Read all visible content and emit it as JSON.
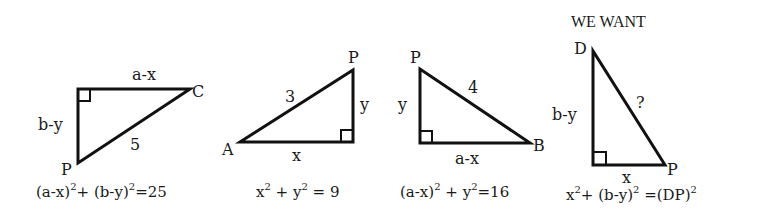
{
  "colors": {
    "ink": "#111111",
    "background": "#ffffff"
  },
  "triangles": [
    {
      "id": "triangle-1",
      "vertices": [
        "C",
        "P"
      ],
      "labels": {
        "top_side": "a-x",
        "left_side": "b-y",
        "hypotenuse": "5",
        "vertex_c": "C",
        "vertex_p": "P"
      },
      "equation": {
        "t1": "(a-x)",
        "s1": "2",
        "t2": "+ (b-y)",
        "s2": "2",
        "t3": "=25"
      }
    },
    {
      "id": "triangle-2",
      "labels": {
        "hypotenuse": "3",
        "right_side": "y",
        "bottom_side": "x",
        "vertex_a": "A",
        "vertex_p": "P"
      },
      "equation": {
        "t1": "x",
        "s1": "2",
        "t2": " + y",
        "s2": "2",
        "t3": " = 9"
      }
    },
    {
      "id": "triangle-3",
      "labels": {
        "hypotenuse": "4",
        "left_side": "y",
        "bottom_side": "a-x",
        "vertex_b": "B",
        "vertex_p": "P"
      },
      "equation": {
        "t1": "(a-x)",
        "s1": "2",
        "t2": " + y",
        "s2": "2",
        "t3": "=16"
      }
    },
    {
      "id": "triangle-4",
      "heading": "WE WANT",
      "labels": {
        "hypotenuse": "?",
        "left_side": "b-y",
        "bottom_side": "x",
        "vertex_d": "D",
        "vertex_p": "P"
      },
      "equation": {
        "t1": "x",
        "s1": "2",
        "t2": "+ (b-y)",
        "s2": "2",
        "t3": " =(DP)",
        "s3": "2"
      }
    }
  ]
}
